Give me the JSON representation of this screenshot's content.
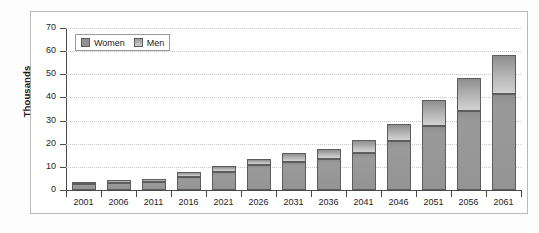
{
  "chart_data": {
    "type": "bar",
    "subtype": "stacked-bar",
    "title": "",
    "xlabel": "",
    "ylabel": "Thousands",
    "ylim": [
      0,
      70
    ],
    "ytick_step": 10,
    "yticks": [
      "70",
      "60",
      "50",
      "40",
      "30",
      "20",
      "10",
      "0"
    ],
    "grid": true,
    "legend_position": "top-left-inside",
    "categories": [
      "2001",
      "2006",
      "2011",
      "2016",
      "2021",
      "2026",
      "2031",
      "2036",
      "2041",
      "2046",
      "2051",
      "2056",
      "2061"
    ],
    "series": [
      {
        "name": "Women",
        "color": "#949494",
        "values": [
          2.5,
          3.0,
          3.4,
          5.6,
          8.0,
          10.6,
          12.2,
          13.4,
          16.0,
          21.0,
          27.8,
          34.3,
          41.4
        ]
      },
      {
        "name": "Men",
        "color": "#c9c9c9",
        "values": [
          1.1,
          1.2,
          1.4,
          2.1,
          2.5,
          3.0,
          3.6,
          4.2,
          5.5,
          7.5,
          11.2,
          14.0,
          16.8
        ]
      }
    ],
    "totals": [
      3.6,
      4.2,
      4.8,
      7.7,
      10.5,
      13.6,
      15.8,
      17.6,
      21.5,
      28.5,
      39.0,
      48.3,
      58.2
    ]
  },
  "legend": {
    "items": [
      {
        "label": "Women",
        "swatch": "women-swatch"
      },
      {
        "label": "Men",
        "swatch": "men-swatch"
      }
    ]
  },
  "axes": {
    "y_title": "Thousands"
  }
}
